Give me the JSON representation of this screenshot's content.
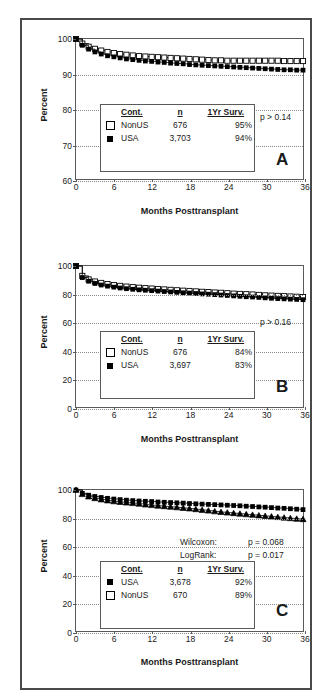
{
  "figure": {
    "panels": [
      {
        "letter": "A",
        "xlabel": "Months Posttransplant",
        "ylabel": "Percent",
        "xticks": [
          "0",
          "6",
          "12",
          "18",
          "24",
          "30",
          "36"
        ],
        "yticks": [
          "60",
          "70",
          "80",
          "90",
          "100"
        ],
        "pvalue": "p > 0.14",
        "legend": {
          "headers": [
            "Cont.",
            "n",
            "1Yr Surv."
          ],
          "rows": [
            {
              "marker": "open-square",
              "cont": "NonUS",
              "n": "676",
              "surv": "95%"
            },
            {
              "marker": "filled-square",
              "cont": "USA",
              "n": "3,703",
              "surv": "94%"
            }
          ]
        }
      },
      {
        "letter": "B",
        "xlabel": "Months Posttransplant",
        "ylabel": "Percent",
        "xticks": [
          "0",
          "6",
          "12",
          "18",
          "24",
          "30",
          "36"
        ],
        "yticks": [
          "0",
          "20",
          "40",
          "60",
          "80",
          "100"
        ],
        "pvalue": "p > 0.16",
        "legend": {
          "headers": [
            "Cont.",
            "n",
            "1Yr Surv."
          ],
          "rows": [
            {
              "marker": "open-square",
              "cont": "NonUS",
              "n": "676",
              "surv": "84%"
            },
            {
              "marker": "filled-square",
              "cont": "USA",
              "n": "3,697",
              "surv": "83%"
            }
          ]
        }
      },
      {
        "letter": "C",
        "xlabel": "Months Posttransplant",
        "ylabel": "Percent",
        "xticks": [
          "0",
          "6",
          "12",
          "18",
          "24",
          "30",
          "36"
        ],
        "yticks": [
          "0",
          "20",
          "40",
          "60",
          "80",
          "100"
        ],
        "stats": [
          {
            "test": "Wilcoxon:",
            "pvalue": "p = 0.068"
          },
          {
            "test": "LogRank:",
            "pvalue": "p = 0.017"
          }
        ],
        "legend": {
          "headers": [
            "Cont.",
            "n",
            "1Yr Surv."
          ],
          "rows": [
            {
              "marker": "filled-square",
              "cont": "USA",
              "n": "3,678",
              "surv": "92%"
            },
            {
              "marker": "open-square",
              "cont": "NonUS",
              "n": "670",
              "surv": "89%"
            }
          ]
        }
      }
    ]
  },
  "chart_data": [
    {
      "type": "line",
      "panel": "A",
      "title": "",
      "xlabel": "Months Posttransplant",
      "ylabel": "Percent",
      "xlim": [
        0,
        36
      ],
      "ylim": [
        60,
        100
      ],
      "xticks": [
        0,
        6,
        12,
        18,
        24,
        30,
        36
      ],
      "yticks": [
        60,
        70,
        80,
        90,
        100
      ],
      "grid": "horizontal-dotted",
      "legend_position": "inside-lower-left",
      "annotations": [
        "p > 0.14",
        "A"
      ],
      "series": [
        {
          "name": "NonUS",
          "n": 676,
          "one_year_survival": 95,
          "marker": "open-square",
          "x": [
            0,
            1,
            2,
            3,
            4,
            5,
            6,
            7,
            8,
            9,
            10,
            11,
            12,
            13,
            14,
            15,
            16,
            17,
            18,
            19,
            20,
            21,
            22,
            23,
            24,
            25,
            26,
            27,
            28,
            29,
            30,
            31,
            32,
            33,
            34,
            35,
            36
          ],
          "values": [
            100,
            98.7,
            97.8,
            97.2,
            96.7,
            96.3,
            96.0,
            95.7,
            95.5,
            95.3,
            95.1,
            95.0,
            94.9,
            94.8,
            94.7,
            94.6,
            94.5,
            94.4,
            94.3,
            94.2,
            94.1,
            94.0,
            93.9,
            93.9,
            93.8,
            93.8,
            93.8,
            93.8,
            93.8,
            93.8,
            93.8,
            93.8,
            93.8,
            93.7,
            93.7,
            93.7,
            93.7
          ]
        },
        {
          "name": "USA",
          "n": 3703,
          "one_year_survival": 94,
          "marker": "filled-square",
          "x": [
            0,
            1,
            2,
            3,
            4,
            5,
            6,
            7,
            8,
            9,
            10,
            11,
            12,
            13,
            14,
            15,
            16,
            17,
            18,
            19,
            20,
            21,
            22,
            23,
            24,
            25,
            26,
            27,
            28,
            29,
            30,
            31,
            32,
            33,
            34,
            35,
            36
          ],
          "values": [
            100,
            98.2,
            97.1,
            96.3,
            95.7,
            95.2,
            94.9,
            94.6,
            94.3,
            94.1,
            93.9,
            93.7,
            93.6,
            93.4,
            93.3,
            93.1,
            93.0,
            92.9,
            92.7,
            92.6,
            92.5,
            92.4,
            92.3,
            92.2,
            92.1,
            92.0,
            91.9,
            91.8,
            91.7,
            91.6,
            91.5,
            91.4,
            91.3,
            91.2,
            91.2,
            91.1,
            91.1
          ]
        }
      ]
    },
    {
      "type": "line",
      "panel": "B",
      "title": "",
      "xlabel": "Months Posttransplant",
      "ylabel": "Percent",
      "xlim": [
        0,
        36
      ],
      "ylim": [
        0,
        100
      ],
      "xticks": [
        0,
        6,
        12,
        18,
        24,
        30,
        36
      ],
      "yticks": [
        0,
        20,
        40,
        60,
        80,
        100
      ],
      "grid": "horizontal-dotted",
      "legend_position": "inside-lower-left",
      "annotations": [
        "p > 0.16",
        "B"
      ],
      "series": [
        {
          "name": "NonUS",
          "n": 676,
          "one_year_survival": 84,
          "marker": "open-square",
          "x": [
            0,
            1,
            2,
            3,
            4,
            5,
            6,
            7,
            8,
            9,
            10,
            11,
            12,
            13,
            14,
            15,
            16,
            17,
            18,
            19,
            20,
            21,
            22,
            23,
            24,
            25,
            26,
            27,
            28,
            29,
            30,
            31,
            32,
            33,
            34,
            35,
            36
          ],
          "values": [
            100,
            93.0,
            90.5,
            89.0,
            88.0,
            87.2,
            86.5,
            85.9,
            85.4,
            85.0,
            84.6,
            84.3,
            84.0,
            83.7,
            83.4,
            83.1,
            82.8,
            82.5,
            82.3,
            82.0,
            81.7,
            81.5,
            81.2,
            81.0,
            80.7,
            80.4,
            80.2,
            80.0,
            79.8,
            79.5,
            79.2,
            79.0,
            78.8,
            78.6,
            78.4,
            78.2,
            78.0
          ]
        },
        {
          "name": "USA",
          "n": 3697,
          "one_year_survival": 83,
          "marker": "filled-square",
          "x": [
            0,
            1,
            2,
            3,
            4,
            5,
            6,
            7,
            8,
            9,
            10,
            11,
            12,
            13,
            14,
            15,
            16,
            17,
            18,
            19,
            20,
            21,
            22,
            23,
            24,
            25,
            26,
            27,
            28,
            29,
            30,
            31,
            32,
            33,
            34,
            35,
            36
          ],
          "values": [
            100,
            91.8,
            89.2,
            87.6,
            86.5,
            85.7,
            85.0,
            84.4,
            83.9,
            83.5,
            83.1,
            82.8,
            82.5,
            82.2,
            81.9,
            81.6,
            81.3,
            81.0,
            80.8,
            80.5,
            80.2,
            80.0,
            79.7,
            79.4,
            79.1,
            78.8,
            78.5,
            78.2,
            78.0,
            77.7,
            77.4,
            77.1,
            76.9,
            76.7,
            76.5,
            76.3,
            76.1
          ]
        }
      ]
    },
    {
      "type": "line",
      "panel": "C",
      "title": "",
      "xlabel": "Months Posttransplant",
      "ylabel": "Percent",
      "xlim": [
        0,
        36
      ],
      "ylim": [
        0,
        100
      ],
      "xticks": [
        0,
        6,
        12,
        18,
        24,
        30,
        36
      ],
      "yticks": [
        0,
        20,
        40,
        60,
        80,
        100
      ],
      "grid": "horizontal-dotted",
      "legend_position": "inside-lower-left",
      "annotations": [
        "Wilcoxon: p = 0.068",
        "LogRank: p = 0.017",
        "C"
      ],
      "series": [
        {
          "name": "USA",
          "n": 3678,
          "one_year_survival": 92,
          "marker": "filled-square",
          "x": [
            0,
            1,
            2,
            3,
            4,
            5,
            6,
            7,
            8,
            9,
            10,
            11,
            12,
            13,
            14,
            15,
            16,
            17,
            18,
            19,
            20,
            21,
            22,
            23,
            24,
            25,
            26,
            27,
            28,
            29,
            30,
            31,
            32,
            33,
            34,
            35,
            36
          ],
          "values": [
            100,
            97.6,
            96.3,
            95.4,
            94.7,
            94.1,
            93.6,
            93.2,
            92.8,
            92.5,
            92.2,
            92.0,
            91.8,
            91.5,
            91.3,
            91.1,
            90.9,
            90.7,
            90.4,
            90.2,
            90.0,
            89.8,
            89.6,
            89.4,
            89.2,
            89.0,
            88.8,
            88.5,
            88.3,
            88.0,
            87.8,
            87.5,
            87.2,
            87.0,
            86.7,
            86.4,
            86.1
          ]
        },
        {
          "name": "NonUS",
          "n": 670,
          "one_year_survival": 89,
          "marker": "open-triangle",
          "x": [
            0,
            1,
            2,
            3,
            4,
            5,
            6,
            7,
            8,
            9,
            10,
            11,
            12,
            13,
            14,
            15,
            16,
            17,
            18,
            19,
            20,
            21,
            22,
            23,
            24,
            25,
            26,
            27,
            28,
            29,
            30,
            31,
            32,
            33,
            34,
            35,
            36
          ],
          "values": [
            100,
            97.0,
            95.3,
            94.1,
            93.2,
            92.5,
            91.9,
            91.4,
            91.0,
            90.6,
            90.2,
            89.6,
            89.2,
            88.8,
            88.4,
            88.0,
            87.6,
            87.2,
            86.8,
            86.3,
            85.8,
            85.3,
            84.8,
            84.3,
            83.9,
            83.5,
            83.1,
            82.7,
            82.3,
            81.9,
            81.5,
            81.1,
            80.7,
            80.3,
            79.9,
            79.5,
            79.2
          ]
        }
      ]
    }
  ]
}
